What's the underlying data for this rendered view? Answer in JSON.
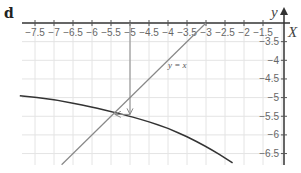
{
  "panel": {
    "label": "d"
  },
  "chart_data": {
    "type": "line",
    "title": "",
    "xlabel": "X",
    "ylabel": "Y",
    "xlim": [
      -7.9,
      -0.95
    ],
    "ylim": [
      -6.8,
      -3.0
    ],
    "grid": true,
    "x_ticks": [
      -7.5,
      -7,
      -6.5,
      -6,
      -5.5,
      -5,
      -4.5,
      -4,
      -3.5,
      -3,
      -2.5,
      -2,
      -1.5
    ],
    "x_tick_labels": [
      "-7.5",
      "-7",
      "-6.5",
      "-6",
      "-5.5",
      "-5",
      "-4.5",
      "-4",
      "-3.5",
      "-3",
      "-2.5",
      "-2",
      "-1.5"
    ],
    "y_ticks": [
      -3.5,
      -4,
      -4.5,
      -5,
      -5.5,
      -6,
      -6.5
    ],
    "y_tick_labels": [
      "-3.5",
      "-4",
      "-4.5",
      "-5",
      "-5.5",
      "-6",
      "-6.5"
    ],
    "series": [
      {
        "name": "curve",
        "color": "#333333",
        "x": [
          -7.9,
          -7.0,
          -6.0,
          -5.4,
          -5.0,
          -4.0,
          -3.0,
          -2.3
        ],
        "y": [
          -4.95,
          -5.05,
          -5.25,
          -5.4,
          -5.5,
          -5.8,
          -6.3,
          -6.75
        ]
      },
      {
        "name": "y = x",
        "color": "#888888",
        "x": [
          -6.8,
          -3.0
        ],
        "y": [
          -6.8,
          -3.0
        ]
      }
    ],
    "annotations": [
      {
        "type": "arrow",
        "from": [
          -5,
          -3
        ],
        "to": [
          -5,
          -5.45
        ],
        "label": ""
      },
      {
        "type": "arrow",
        "from": [
          -5,
          -5.45
        ],
        "to": [
          -5.4,
          -5.45
        ],
        "label": ""
      },
      {
        "type": "text",
        "at": [
          -4.0,
          -4.2
        ],
        "text": "y = x"
      }
    ],
    "legend": "none"
  },
  "labels": {
    "x_axis": "X",
    "y_axis": "Y",
    "line_label": "y = x"
  }
}
